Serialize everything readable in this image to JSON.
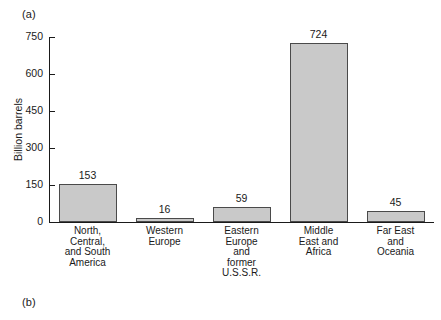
{
  "panel_labels": {
    "a": "(a)",
    "b": "(b)"
  },
  "chart_data": {
    "type": "bar",
    "title": "",
    "xlabel": "",
    "ylabel": "Billion barrels",
    "ylim": [
      0,
      750
    ],
    "yticks": [
      0,
      150,
      300,
      450,
      600,
      750
    ],
    "ytick_labels": [
      "0",
      "150",
      "300",
      "450",
      "600",
      "750"
    ],
    "grid": false,
    "legend": null,
    "bar_fill_color": "#c9c9c9",
    "bar_edge_color": "#4a4a4a",
    "categories": [
      "North, Central, and South America",
      "Western Europe",
      "Eastern Europe and former U.S.S.R.",
      "Middle East and Africa",
      "Far East and Oceania"
    ],
    "category_label_lines": [
      [
        "North,",
        "Central,",
        "and South",
        "America"
      ],
      [
        "Western",
        "Europe"
      ],
      [
        "Eastern",
        "Europe",
        "and",
        "former",
        "U.S.S.R."
      ],
      [
        "Middle",
        "East and",
        "Africa"
      ],
      [
        "Far East",
        "and",
        "Oceania"
      ]
    ],
    "values": [
      153,
      16,
      59,
      724,
      45
    ],
    "value_labels": [
      "153",
      "16",
      "59",
      "724",
      "45"
    ]
  }
}
